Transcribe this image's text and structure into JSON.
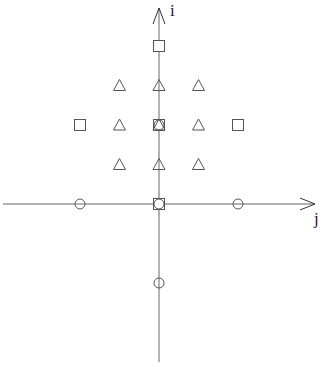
{
  "diagram": {
    "type": "lattice-stencil",
    "axes": {
      "vertical": {
        "label": "i",
        "origin_px": [
          159,
          204
        ],
        "top_px": 8,
        "bottom_px": 362
      },
      "horizontal": {
        "label": "j",
        "left_px": 3,
        "right_px": 315
      }
    },
    "unit_px": 39.5,
    "colors": {
      "stroke": "#555555",
      "axis": "#666666",
      "text": "#222222"
    },
    "points": {
      "squares": [
        [
          4,
          0
        ],
        [
          2,
          -2
        ],
        [
          2,
          0
        ],
        [
          2,
          2
        ],
        [
          0,
          0
        ]
      ],
      "triangles": [
        [
          3,
          -1
        ],
        [
          3,
          0
        ],
        [
          3,
          1
        ],
        [
          2,
          -1
        ],
        [
          2,
          0
        ],
        [
          2,
          1
        ],
        [
          1,
          -1
        ],
        [
          1,
          0
        ],
        [
          1,
          1
        ]
      ],
      "circles": [
        [
          0,
          -2
        ],
        [
          0,
          0
        ],
        [
          0,
          2
        ],
        [
          -2,
          0
        ],
        [
          2,
          0
        ]
      ]
    }
  }
}
